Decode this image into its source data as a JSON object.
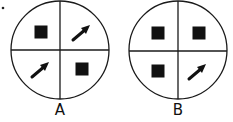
{
  "bullet": "•",
  "figures": [
    {
      "label": "A",
      "quadrants": {
        "top_left": "square",
        "top_right": "arrow",
        "bottom_left": "arrow",
        "bottom_right": "square"
      }
    },
    {
      "label": "B",
      "quadrants": {
        "top_left": "square",
        "top_right": "square",
        "bottom_left": "square",
        "bottom_right": "arrow"
      }
    }
  ],
  "colors": {
    "stroke": "#1a1a1a",
    "fill": "#111111",
    "background": "#ffffff"
  }
}
